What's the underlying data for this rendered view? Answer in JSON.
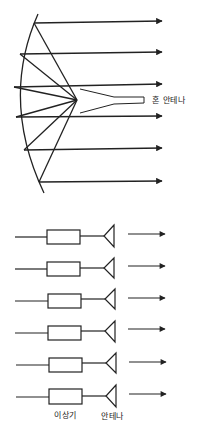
{
  "figure": {
    "top": {
      "title": "Parabolic reflector fed by horn antenna",
      "horn_label": "혼 안테나",
      "ray_count": 6
    },
    "bottom": {
      "title": "Phased array of antenna elements",
      "element_count": 6,
      "phase_shifter_label": "이상기",
      "antenna_label": "안테나"
    }
  }
}
